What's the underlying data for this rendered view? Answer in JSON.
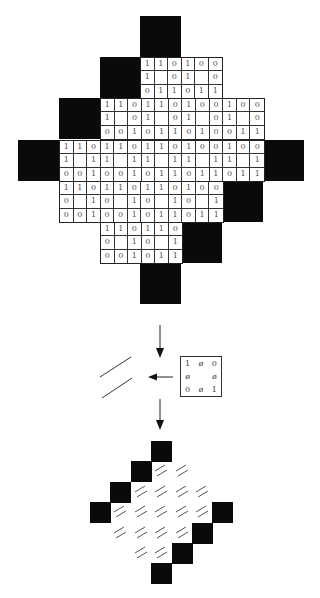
{
  "upper_diagram": {
    "black_blocks": [
      {
        "x": 140,
        "y": 16
      },
      {
        "x": 100,
        "y": 57
      },
      {
        "x": 59,
        "y": 98
      },
      {
        "x": 18,
        "y": 140
      },
      {
        "x": 263,
        "y": 140
      },
      {
        "x": 222,
        "y": 181
      },
      {
        "x": 181,
        "y": 222
      },
      {
        "x": 140,
        "y": 263
      }
    ],
    "bands": [
      {
        "x": 140,
        "y": 57,
        "cols": 6,
        "rows": [
          [
            "1",
            "1",
            "0",
            "1",
            "0",
            "0"
          ],
          [
            "1",
            "",
            "0",
            "1",
            "",
            "0"
          ],
          [
            "0",
            "1",
            "1",
            "0",
            "1",
            "1"
          ]
        ]
      },
      {
        "x": 100,
        "y": 98,
        "cols": 12,
        "rows": [
          [
            "1",
            "1",
            "0",
            "1",
            "1",
            "0",
            "1",
            "0",
            "0",
            "1",
            "0",
            "0"
          ],
          [
            "1",
            "",
            "0",
            "1",
            "",
            "0",
            "1",
            "",
            "0",
            "1",
            "",
            "0"
          ],
          [
            "0",
            "0",
            "1",
            "0",
            "1",
            "1",
            "0",
            "1",
            "0",
            "0",
            "1",
            "1"
          ]
        ]
      },
      {
        "x": 59,
        "y": 140,
        "cols": 15,
        "rows": [
          [
            "1",
            "1",
            "0",
            "1",
            "1",
            "0",
            "1",
            "1",
            "0",
            "1",
            "0",
            "0",
            "1",
            "0",
            "0"
          ],
          [
            "1",
            "",
            "1",
            "1",
            "",
            "1",
            "1",
            "",
            "1",
            "1",
            "",
            "1",
            "1",
            "",
            "1"
          ],
          [
            "0",
            "0",
            "1",
            "0",
            "0",
            "1",
            "0",
            "1",
            "1",
            "0",
            "1",
            "1",
            "0",
            "1",
            "1"
          ]
        ]
      },
      {
        "x": 59,
        "y": 181,
        "cols": 12,
        "rows": [
          [
            "1",
            "1",
            "0",
            "1",
            "1",
            "0",
            "1",
            "1",
            "0",
            "1",
            "0",
            "0"
          ],
          [
            "0",
            "",
            "1",
            "0",
            "",
            "1",
            "0",
            "",
            "1",
            "0",
            "",
            "1"
          ],
          [
            "0",
            "0",
            "1",
            "0",
            "0",
            "1",
            "0",
            "1",
            "1",
            "0",
            "1",
            "1"
          ]
        ]
      },
      {
        "x": 100,
        "y": 222,
        "cols": 6,
        "rows": [
          [
            "1",
            "1",
            "0",
            "1",
            "1",
            "0"
          ],
          [
            "0",
            "",
            "1",
            "0",
            "",
            "1"
          ],
          [
            "0",
            "0",
            "1",
            "0",
            "1",
            "1"
          ]
        ]
      }
    ]
  },
  "kernel_box": {
    "cells": [
      "1",
      "ø",
      "0",
      "ø",
      "",
      "ø",
      "0",
      "ø",
      "1"
    ]
  },
  "lower_diagram": {
    "black_cells": [
      [
        0,
        3
      ],
      [
        1,
        2
      ],
      [
        2,
        1
      ],
      [
        3,
        0
      ],
      [
        3,
        6
      ],
      [
        4,
        5
      ],
      [
        5,
        4
      ],
      [
        6,
        3
      ]
    ],
    "hatch_cells": [
      [
        1,
        3
      ],
      [
        1,
        4
      ],
      [
        2,
        2
      ],
      [
        2,
        3
      ],
      [
        2,
        4
      ],
      [
        2,
        5
      ],
      [
        3,
        1
      ],
      [
        3,
        2
      ],
      [
        3,
        3
      ],
      [
        3,
        4
      ],
      [
        3,
        5
      ],
      [
        4,
        1
      ],
      [
        4,
        2
      ],
      [
        4,
        3
      ],
      [
        4,
        4
      ],
      [
        5,
        2
      ],
      [
        5,
        3
      ]
    ]
  },
  "arrows": [
    {
      "name": "arrow-down-1",
      "direction": "down"
    },
    {
      "name": "arrow-left",
      "direction": "left"
    },
    {
      "name": "arrow-down-2",
      "direction": "down"
    }
  ]
}
